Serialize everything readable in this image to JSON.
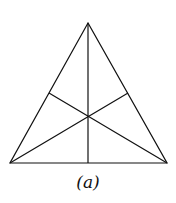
{
  "figure": {
    "caption": "(a)",
    "stroke_color": "#111111",
    "vertices": {
      "apex": [
        88,
        23
      ],
      "left": [
        10,
        163
      ],
      "right": [
        167,
        163
      ]
    },
    "midpoints": {
      "base": [
        88,
        163
      ],
      "left_side": [
        49,
        93
      ],
      "right_side": [
        128,
        93
      ]
    }
  }
}
